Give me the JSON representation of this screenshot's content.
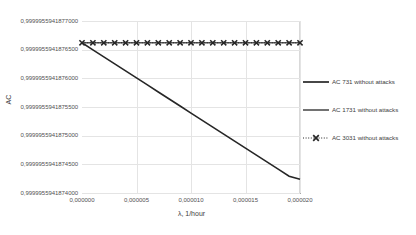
{
  "chart_data": {
    "type": "line",
    "title": "",
    "xlabel": "λ, 1/hour",
    "ylabel": "AC",
    "xlim": [
      0.0,
      2e-05
    ],
    "ylim": [
      0.9999955941874,
      0.9999955941877
    ],
    "grid": true,
    "legend_position": "right",
    "x_ticks": [
      "0,000000",
      "0,000005",
      "0,000010",
      "0,000015",
      "0,000020"
    ],
    "x_tick_values": [
      0.0,
      5e-06,
      1e-05,
      1.5e-05,
      2e-05
    ],
    "y_ticks": [
      "0,9999955941877000",
      "0,9999955941876500",
      "0,9999955941876000",
      "0,9999955941875500",
      "0,9999955941875000",
      "0,9999955941874500",
      "0,9999955941874000"
    ],
    "y_tick_values": [
      0.9999955941877,
      0.99999559418765,
      0.9999955941876,
      0.99999559418755,
      0.9999955941875,
      0.99999559418745,
      0.9999955941874
    ],
    "x": [
      0.0,
      1e-06,
      2e-06,
      3e-06,
      4e-06,
      5e-06,
      6e-06,
      7e-06,
      8e-06,
      9e-06,
      1e-05,
      1.1e-05,
      1.2e-05,
      1.3e-05,
      1.4e-05,
      1.5e-05,
      1.6e-05,
      1.7e-05,
      1.8e-05,
      1.9e-05,
      2e-05
    ],
    "series": [
      {
        "name": "AC 731 without attacks",
        "style": "solid",
        "marker": "none",
        "color": "#262626",
        "values": [
          0.999995594187662,
          0.9999955941876497,
          0.9999955941876375,
          0.9999955941876253,
          0.999995594187613,
          0.9999955941876008,
          0.9999955941875885,
          0.9999955941875762,
          0.999995594187564,
          0.9999955941875518,
          0.9999955941875395,
          0.9999955941875273,
          0.999995594187515,
          0.9999955941875027,
          0.9999955941874905,
          0.9999955941874783,
          0.999995594187466,
          0.9999955941874538,
          0.9999955941874415,
          0.9999955941874292,
          0.999995594187424
        ]
      },
      {
        "name": "AC 1731 without attacks",
        "style": "solid",
        "marker": "none",
        "color": "#595959",
        "values": [
          0.999995594187662,
          0.999995594187662,
          0.999995594187662,
          0.999995594187662,
          0.999995594187662,
          0.999995594187662,
          0.999995594187662,
          0.999995594187662,
          0.999995594187662,
          0.999995594187662,
          0.999995594187662,
          0.999995594187662,
          0.999995594187662,
          0.999995594187662,
          0.999995594187662,
          0.999995594187662,
          0.999995594187662,
          0.999995594187662,
          0.999995594187662,
          0.999995594187662,
          0.999995594187662
        ]
      },
      {
        "name": "AC 3031 without attacks",
        "style": "dotted",
        "marker": "x",
        "color": "#262626",
        "values": [
          0.999995594187662,
          0.999995594187662,
          0.999995594187662,
          0.999995594187662,
          0.999995594187662,
          0.999995594187662,
          0.999995594187662,
          0.999995594187662,
          0.999995594187662,
          0.999995594187662,
          0.999995594187662,
          0.999995594187662,
          0.999995594187662,
          0.999995594187662,
          0.999995594187662,
          0.999995594187662,
          0.999995594187662,
          0.999995594187662,
          0.999995594187662,
          0.999995594187662,
          0.999995594187662
        ]
      }
    ]
  },
  "axes": {
    "y_title": "AC",
    "x_title": "λ, 1/hour"
  },
  "legend": {
    "items": [
      {
        "label": "AC 731 without attacks"
      },
      {
        "label": "AC 1731 without attacks"
      },
      {
        "label": "AC 3031 without attacks"
      }
    ]
  },
  "colors": {
    "series_1": "#262626",
    "series_2": "#595959",
    "series_3": "#262626",
    "grid": "#e4e4e4",
    "axis": "#a6a6a6",
    "text": "#404040",
    "background": "#ffffff"
  }
}
